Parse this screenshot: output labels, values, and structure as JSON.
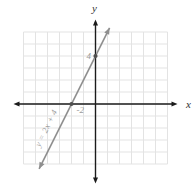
{
  "figure": {
    "background": "#ffffff"
  },
  "chart_data": {
    "type": "line",
    "title": "",
    "equation_label": "y = 2x + 4",
    "x_axis_label": "x",
    "y_axis_label": "y",
    "xlim": [
      -6,
      6
    ],
    "ylim": [
      -5,
      6
    ],
    "grid": true,
    "slope": 2,
    "y_intercept": 4,
    "line_extent_y": [
      -5.4,
      6.35
    ],
    "points": [
      {
        "x": -2,
        "y": 0,
        "label": "-2",
        "label_side": "below-right"
      },
      {
        "x": 0,
        "y": 4,
        "label": "4",
        "label_side": "left"
      }
    ],
    "colors": {
      "line": "#8f8f8f",
      "points": "#4f4f4f",
      "axes": "#1b1b1b",
      "grid": "#e3e3e3",
      "value_labels": "#9b9b9b",
      "axis_labels": "#333333"
    }
  }
}
